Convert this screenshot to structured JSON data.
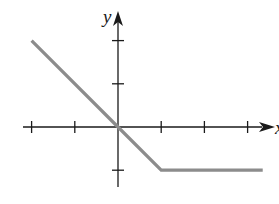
{
  "chart_data": {
    "type": "line",
    "title": "",
    "xlabel": "x",
    "ylabel": "y",
    "xlim": [
      -2.0,
      3.5
    ],
    "ylim": [
      -1.5,
      2.7
    ],
    "x_ticks": [
      -2,
      -1,
      1,
      2,
      3
    ],
    "y_ticks": [
      -1,
      1,
      2
    ],
    "grid": false,
    "legend": null,
    "series": [
      {
        "name": "piecewise",
        "x": [
          -2,
          0,
          1,
          3.35
        ],
        "y": [
          2,
          0,
          -1,
          -1
        ],
        "color": "#8c8c8c"
      }
    ],
    "colors": {
      "axis": "#1a1a1a",
      "line": "#8c8c8c"
    }
  }
}
